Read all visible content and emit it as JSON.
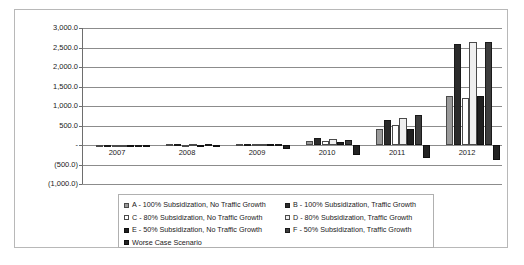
{
  "chart_data": {
    "type": "bar",
    "title": "",
    "xlabel": "",
    "ylabel": "",
    "categories": [
      "2007",
      "2008",
      "2009",
      "2010",
      "2011",
      "2012"
    ],
    "ylim": [
      -1000,
      3000
    ],
    "ytick_labels": [
      "3,000.0",
      "2,500.0",
      "2,000.0",
      "1,500.0",
      "1,000.0",
      "500.0",
      "-",
      "(500.0)",
      "(1,000.0)"
    ],
    "ytick_values": [
      3000,
      2500,
      2000,
      1500,
      1000,
      500,
      0,
      -500,
      -1000
    ],
    "grid": true,
    "legend_position": "bottom",
    "series": [
      {
        "name": "A - 100% Subsidization, No Traffic Growth",
        "key": "A",
        "color": "#9a9a9a",
        "values": [
          10,
          15,
          25,
          110,
          400,
          1250
        ]
      },
      {
        "name": "B - 100% Subsidization, Traffic Growth",
        "key": "B",
        "color": "#2b2b2b",
        "values": [
          12,
          20,
          35,
          180,
          650,
          2600
        ]
      },
      {
        "name": "C - 80% Subsidization, No Traffic Growth",
        "key": "C",
        "color": "#ffffff",
        "values": [
          8,
          12,
          20,
          95,
          520,
          1200
        ]
      },
      {
        "name": "D - 80% Subsidization, Traffic Growth",
        "key": "D",
        "color": "#efefef",
        "values": [
          10,
          15,
          28,
          150,
          700,
          2650
        ]
      },
      {
        "name": "E - 50% Subsidization, No Traffic Growth",
        "key": "E",
        "color": "#1f1f1f",
        "values": [
          6,
          10,
          18,
          70,
          400,
          1250
        ]
      },
      {
        "name": "F - 50% Subsidization, Traffic Growth",
        "key": "F",
        "color": "#3d3d3d",
        "values": [
          8,
          14,
          25,
          130,
          760,
          2650
        ]
      },
      {
        "name": "Worse Case Scenario",
        "key": "G",
        "color": "#232323",
        "values": [
          -15,
          -30,
          -90,
          -260,
          -330,
          -390
        ]
      }
    ]
  },
  "legend": {
    "rows": [
      [
        {
          "key": "A",
          "label": "A - 100% Subsidization, No Traffic Growth"
        },
        {
          "key": "B",
          "label": "B - 100% Subsidization, Traffic Growth"
        }
      ],
      [
        {
          "key": "C",
          "label": "C - 80% Subsidization, No Traffic Growth"
        },
        {
          "key": "D",
          "label": "D - 80% Subsidization, Traffic Growth"
        }
      ],
      [
        {
          "key": "E",
          "label": "E - 50% Subsidization, No Traffic Growth"
        },
        {
          "key": "F",
          "label": "F - 50% Subsidization, Traffic Growth"
        }
      ],
      [
        {
          "key": "G",
          "label": "Worse Case Scenario"
        }
      ]
    ]
  }
}
